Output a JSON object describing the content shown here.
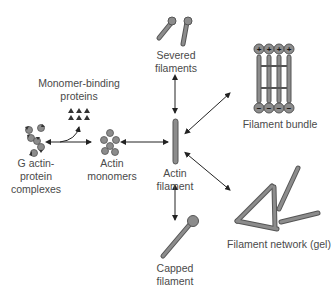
{
  "diagram": {
    "colors": {
      "fill": "#8c8c8c",
      "stroke": "#555555",
      "arrow": "#222222",
      "text": "#4a4a4a"
    },
    "nodes": {
      "g_actin_complexes": {
        "line1": "G actin-",
        "line2": "protein",
        "line3": "complexes"
      },
      "monomer_binding_proteins": {
        "line1": "Monomer-binding",
        "line2": "proteins"
      },
      "actin_monomers": {
        "line1": "Actin",
        "line2": "monomers"
      },
      "actin_filament": {
        "line1": "Actin",
        "line2": "filament"
      },
      "severed_filaments": {
        "line1": "Severed",
        "line2": "filaments"
      },
      "filament_bundle": {
        "line1": "Filament bundle",
        "plus_ends": [
          "+",
          "+",
          "+",
          "+"
        ],
        "minus_ends": [
          "−",
          "−",
          "−",
          "−"
        ]
      },
      "filament_network": {
        "line1": "Filament network (gel)"
      },
      "capped_filament": {
        "line1": "Capped",
        "line2": "filament"
      }
    },
    "edges": [
      {
        "from": "g_actin_complexes",
        "to": "actin_monomers",
        "type": "bidirectional"
      },
      {
        "from": "g_actin_complexes",
        "to": "monomer_binding_proteins",
        "type": "curved"
      },
      {
        "from": "actin_monomers",
        "to": "actin_filament",
        "type": "bidirectional"
      },
      {
        "from": "actin_filament",
        "to": "severed_filaments",
        "type": "bidirectional"
      },
      {
        "from": "actin_filament",
        "to": "filament_bundle",
        "type": "bidirectional"
      },
      {
        "from": "actin_filament",
        "to": "filament_network",
        "type": "bidirectional"
      },
      {
        "from": "actin_filament",
        "to": "capped_filament",
        "type": "bidirectional"
      }
    ]
  }
}
